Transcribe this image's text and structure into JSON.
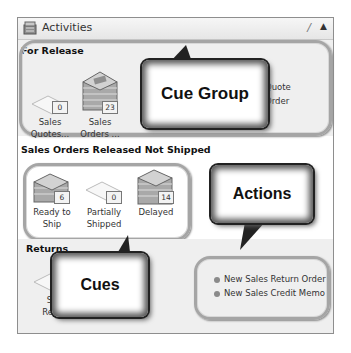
{
  "panel": {
    "title": "Activities",
    "pin_icon": "pin-icon",
    "collapse_icon": "chevron-up-icon"
  },
  "sections": [
    {
      "title": "For Release",
      "cues": [
        {
          "label_line1": "Sales",
          "label_line2": "Quotes...",
          "count": "0",
          "icon": "empty-document-icon"
        },
        {
          "label_line1": "Sales",
          "label_line2": "Orders ...",
          "count": "23",
          "icon": "document-stack-icon"
        }
      ],
      "actions_partial": [
        "Quote",
        "Order"
      ]
    },
    {
      "title": "Sales Orders Released Not Shipped",
      "cues": [
        {
          "label_line1": "Ready to",
          "label_line2": "Ship",
          "count": "6",
          "icon": "document-stack-icon"
        },
        {
          "label_line1": "Partially",
          "label_line2": "Shipped",
          "count": "0",
          "icon": "empty-document-icon"
        },
        {
          "label_line1": "Delayed",
          "label_line2": "",
          "count": "14",
          "icon": "document-stack-icon"
        }
      ]
    },
    {
      "title": "Returns",
      "cues": [
        {
          "label_line1": "Sa",
          "label_line2": "Retu",
          "icon": "empty-document-icon"
        }
      ],
      "actions": [
        {
          "label": "New Sales Return Order"
        },
        {
          "label": "New Sales Credit Memo"
        }
      ]
    }
  ],
  "callouts": {
    "cue_group": "Cue Group",
    "actions": "Actions",
    "cues": "Cues"
  }
}
